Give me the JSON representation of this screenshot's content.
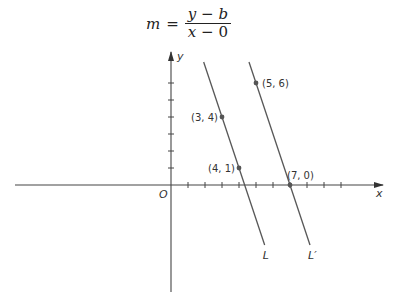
{
  "equation": {
    "lhs": "m",
    "equals": "=",
    "numerator": {
      "a": "y",
      "op": "−",
      "b": "b"
    },
    "denominator": {
      "a": "x",
      "op": "−",
      "b": "0"
    }
  },
  "axes": {
    "x_label": "x",
    "y_label": "y",
    "origin_label": "O",
    "unit_px": 17,
    "x_ticks": [
      1,
      2,
      3,
      4,
      5,
      6,
      7,
      8,
      9,
      10
    ],
    "y_ticks": [
      1,
      2,
      3,
      4,
      5,
      6
    ]
  },
  "lines": [
    {
      "name": "L",
      "label": "L",
      "slope": -3,
      "intercept": 13
    },
    {
      "name": "L-prime",
      "label": "L′",
      "slope": -3,
      "intercept": 21
    }
  ],
  "points": [
    {
      "label": "(3, 4)",
      "x": 3,
      "y": 4,
      "on": "L"
    },
    {
      "label": "(4, 1)",
      "x": 4,
      "y": 1,
      "on": "L"
    },
    {
      "label": "(5, 6)",
      "x": 5,
      "y": 6,
      "on": "L′"
    },
    {
      "label": "(7, 0)",
      "x": 7,
      "y": 0,
      "on": "L′"
    }
  ],
  "colors": {
    "ink": "#333333",
    "point": "#555555"
  }
}
